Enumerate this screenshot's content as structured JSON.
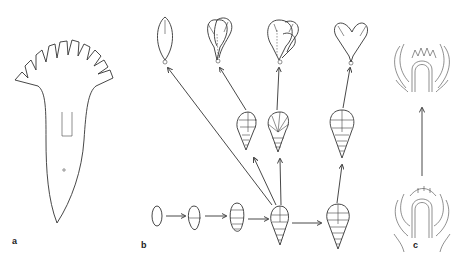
{
  "figure": {
    "panels": [
      {
        "id": "a",
        "label": "a",
        "description": "Flattened corolla outline with fringed lobes and tubular base"
      },
      {
        "id": "b",
        "label": "b",
        "description": "Developmental series of segmented primordia giving rise to corolla forms"
      },
      {
        "id": "c",
        "label": "c",
        "description": "Longitudinal sections of floral apex, early to late stage"
      }
    ],
    "series_b": {
      "bottom_row_count": 5,
      "middle_row_count": 3,
      "top_row_count": 4
    },
    "colors": {
      "line": "#333333",
      "background": "#ffffff"
    }
  }
}
